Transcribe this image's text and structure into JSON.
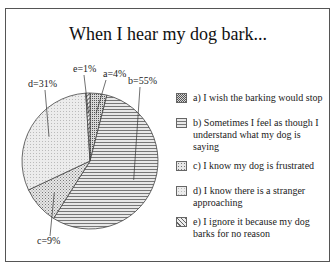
{
  "chart_data": {
    "type": "pie",
    "title": "When I hear my dog bark...",
    "start": "top",
    "direction": "clockwise",
    "slices": [
      {
        "key": "a",
        "label": "a=4%",
        "value": 4,
        "legend": "a) I wish the barking would stop",
        "pattern": "dots-dense"
      },
      {
        "key": "b",
        "label": "b=55%",
        "value": 55,
        "legend": "b) Sometimes I feel as though I understand what my dog is saying",
        "pattern": "horizontal-lines"
      },
      {
        "key": "c",
        "label": "c=9%",
        "value": 9,
        "legend": "c) I know my dog is frustrated",
        "pattern": "dots"
      },
      {
        "key": "d",
        "label": "d=31%",
        "value": 31,
        "legend": "d) I know there is a stranger approaching",
        "pattern": "light-dots"
      },
      {
        "key": "e",
        "label": "e=1%",
        "value": 1,
        "legend": "e) I ignore it because my dog barks for no reason",
        "pattern": "diagonal-lines"
      }
    ],
    "legend_position": "right"
  }
}
